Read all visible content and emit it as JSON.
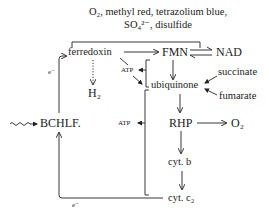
{
  "title": {
    "line1": "O₂, methyl red, tetrazolium blue,",
    "line2": "SO₄²⁻, disulfide"
  },
  "nodes": {
    "ferredoxin": "ferredoxin",
    "fmn": "FMN",
    "nad": "NAD",
    "h2": "H₂",
    "atp_upper": "ATP",
    "ubiquinone": "ubiquinone",
    "succinate": "succinate",
    "fumarate": "fumarate",
    "bchlf": "BCHLF.",
    "atp_lower": "ATP",
    "rhp": "RHP",
    "o2": "O₂",
    "cyt_b": "cyt. b",
    "cyt_c2": "cyt. c₂"
  },
  "edge_labels": {
    "e_left": "e⁻",
    "e_bottom": "e⁻"
  },
  "edges": [
    {
      "from": "BCHLF.",
      "to": "ferredoxin",
      "label": "e⁻"
    },
    {
      "from": "ferredoxin",
      "to": "FMN"
    },
    {
      "from": "FMN",
      "to": "NAD",
      "type": "reversible"
    },
    {
      "from": "ferredoxin",
      "to": "H₂",
      "type": "dotted"
    },
    {
      "from": "FMN",
      "to": "ubiquinone"
    },
    {
      "from": "succinate",
      "to": "ubiquinone"
    },
    {
      "from": "fumarate",
      "to": "ubiquinone"
    },
    {
      "from": "ubiquinone",
      "to": "RHP"
    },
    {
      "from": "RHP",
      "to": "O₂"
    },
    {
      "from": "RHP",
      "to": "cyt. b"
    },
    {
      "from": "cyt. b",
      "to": "cyt. c₂"
    },
    {
      "from": "cyt. c₂",
      "to": "BCHLF.",
      "label": "e⁻"
    },
    {
      "from": "light",
      "to": "BCHLF.",
      "type": "wavy"
    },
    {
      "from": "bracket-upper",
      "to": "ATP"
    },
    {
      "from": "bracket-lower",
      "to": "ATP"
    }
  ]
}
